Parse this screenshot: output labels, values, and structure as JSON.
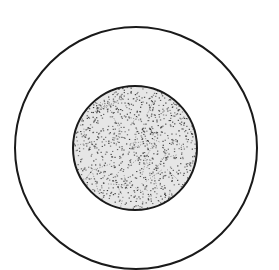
{
  "diagram": {
    "colors": {
      "background": "#ffffff",
      "stroke": "#1a1a1a",
      "inner_fill": "#e6e6e6",
      "stipple": "#333333"
    },
    "outer_circle": {
      "cx": 136,
      "cy": 148,
      "r": 121
    },
    "inner_circle": {
      "cx": 135,
      "cy": 148,
      "r": 62
    }
  }
}
